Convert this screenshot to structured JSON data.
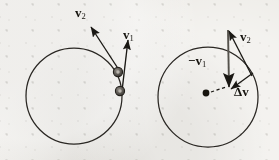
{
  "figure": {
    "name": "circular-motion-velocity-change-diagram",
    "background_color": "#eceae5",
    "ink_color": "#1a1814",
    "width": 279,
    "height": 160
  },
  "left_panel": {
    "name": "trajectory-panel",
    "circle": {
      "cx": 74,
      "cy": 96,
      "r": 48,
      "label": "circular-path"
    },
    "particles": [
      {
        "name": "particle-position-2",
        "cx": 118,
        "cy": 72,
        "r": 4.6
      },
      {
        "name": "particle-position-1",
        "cx": 120,
        "cy": 91,
        "r": 4.6
      }
    ],
    "vectors": [
      {
        "name": "velocity-v1-arrow",
        "label": "v",
        "subscript": "1",
        "sign": "",
        "from": [
          122,
          91
        ],
        "to": [
          128,
          38
        ]
      },
      {
        "name": "velocity-v2-arrow",
        "label": "v",
        "subscript": "2",
        "sign": "",
        "from": [
          119,
          70
        ],
        "to": [
          90,
          25
        ]
      }
    ]
  },
  "right_panel": {
    "name": "vector-subtraction-panel",
    "circle": {
      "cx": 208,
      "cy": 97,
      "r": 50,
      "label": "reference-circle"
    },
    "center_dot": {
      "name": "circle-center-dot",
      "cx": 206,
      "cy": 93,
      "r": 3.4
    },
    "dashed_line": {
      "name": "radius-dashed-line",
      "from": [
        210,
        92
      ],
      "to": [
        227,
        87
      ]
    },
    "vectors": [
      {
        "name": "negative-velocity-v1-arrow",
        "label": "v",
        "subscript": "1",
        "sign": "−",
        "from": [
          228,
          30
        ],
        "to": [
          229,
          89
        ]
      },
      {
        "name": "velocity-v2-arrow",
        "label": "v",
        "subscript": "2",
        "sign": "",
        "from": [
          252,
          76
        ],
        "to": [
          229,
          29
        ]
      },
      {
        "name": "delta-v-arrow",
        "label": "v",
        "subscript": "",
        "sign": "Δ",
        "from": [
          252,
          74
        ],
        "to": [
          229,
          90
        ]
      }
    ]
  },
  "labels": {
    "v1_left": {
      "sign": "",
      "symbol": "v",
      "subscript": "1"
    },
    "v2_left": {
      "sign": "",
      "symbol": "v",
      "subscript": "2"
    },
    "neg_v1_right": {
      "sign": "−",
      "symbol": "v",
      "subscript": "1"
    },
    "v2_right": {
      "sign": "",
      "symbol": "v",
      "subscript": "2"
    },
    "delta_v": {
      "sign": "Δ",
      "symbol": "v",
      "subscript": ""
    }
  }
}
